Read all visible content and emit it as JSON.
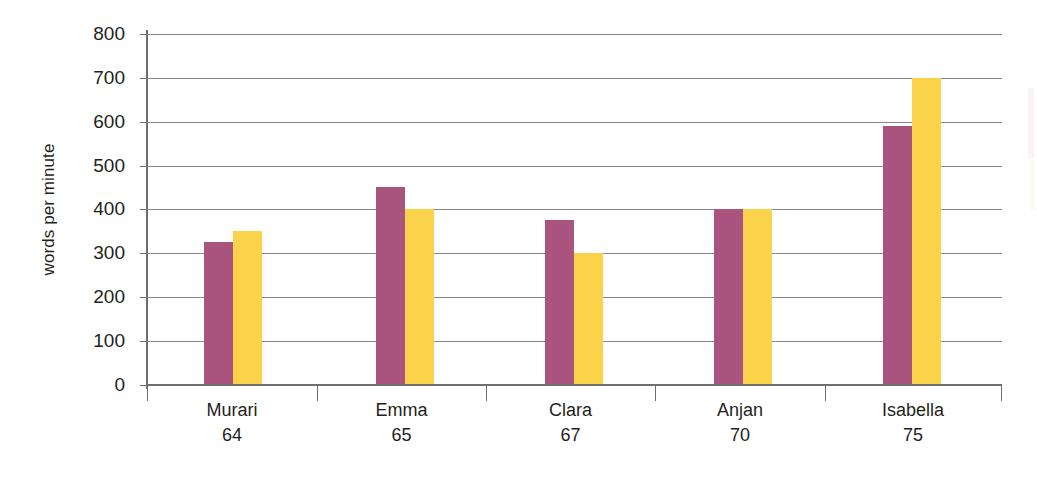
{
  "chart_data": {
    "type": "bar",
    "title": "",
    "subtitle": "",
    "xlabel": "",
    "ylabel": "words per minute",
    "categories": [
      "Murari",
      "Emma",
      "Clara",
      "Anjan",
      "Isabella"
    ],
    "category_sublabels": [
      "64",
      "65",
      "67",
      "70",
      "75"
    ],
    "series": [
      {
        "name": "series-1",
        "color": "#a9537f",
        "values": [
          325,
          450,
          375,
          400,
          590
        ]
      },
      {
        "name": "series-2",
        "color": "#fbd34a",
        "values": [
          350,
          400,
          300,
          400,
          700
        ]
      }
    ],
    "ylim": [
      0,
      800
    ],
    "y_ticks": [
      0,
      100,
      200,
      300,
      400,
      500,
      600,
      700,
      800
    ],
    "y_tick_labels": [
      "0",
      "100",
      "200",
      "300",
      "400",
      "500",
      "600",
      "700",
      "800"
    ],
    "grid": true,
    "legend": "none",
    "legend_position": "none"
  },
  "axis": {
    "y_title": "words per minute",
    "tick_0": "0",
    "tick_100": "100",
    "tick_200": "200",
    "tick_300": "300",
    "tick_400": "400",
    "tick_500": "500",
    "tick_600": "600",
    "tick_700": "700",
    "tick_800": "800"
  },
  "categories": [
    {
      "name": "Murari",
      "number": "64"
    },
    {
      "name": "Emma",
      "number": "65"
    },
    {
      "name": "Clara",
      "number": "67"
    },
    {
      "name": "Anjan",
      "number": "70"
    },
    {
      "name": "Isabella",
      "number": "75"
    }
  ],
  "colors": {
    "series_1": "#a9537f",
    "series_2": "#fbd34a",
    "gridline": "#88868a",
    "axis": "#6e6e70",
    "text": "#231f20",
    "background": "#ffffff"
  }
}
